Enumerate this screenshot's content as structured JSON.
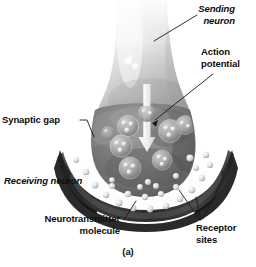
{
  "figure": {
    "caption": "(a)",
    "labels": {
      "sending_neuron": "Sending\nneuron",
      "action_potential": "Action\npotential",
      "synaptic_gap": "Synaptic gap",
      "receiving_neuron": "Receiving neuron",
      "neurotransmitter_molecule": "Neurotransmitter\nmolecule",
      "receptor_sites": "Receptor\nsites"
    },
    "colors": {
      "background": "#ffffff",
      "text": "#0d0d0d",
      "leader_line": "#1a1a1a",
      "axon_light": "#e8e8e8",
      "axon_mid": "#bdbdbd",
      "terminal_gray": "#7d7d7d",
      "terminal_dark": "#4a4a4a",
      "membrane_dark": "#2b2b2b",
      "vesicle_light": "#d6d6d6",
      "molecule_bright": "#efefef",
      "gap_white": "#fdfdfd"
    }
  }
}
